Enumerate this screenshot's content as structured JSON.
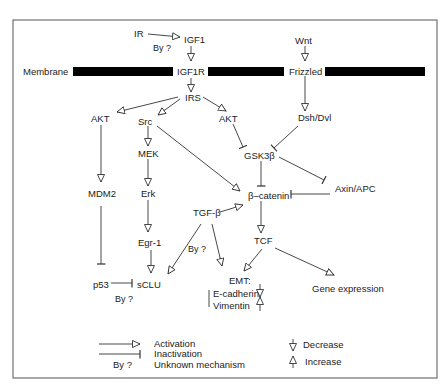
{
  "nodes": {
    "ir": {
      "label": "IR",
      "x": 138,
      "y": 37
    },
    "igf1": {
      "label": "IGF1",
      "x": 193,
      "y": 43
    },
    "by_ir": {
      "label": "By ?",
      "x": 153,
      "y": 51
    },
    "membrane": {
      "label": "Membrane",
      "x": 24,
      "y": 74
    },
    "igf1r": {
      "label": "IGF1R",
      "x": 178,
      "y": 74
    },
    "wnt": {
      "label": "Wnt",
      "x": 296,
      "y": 43
    },
    "frizzled": {
      "label": "Frizzled",
      "x": 290,
      "y": 71
    },
    "irs": {
      "label": "IRS",
      "x": 185,
      "y": 100
    },
    "akt_left": {
      "label": "AKT",
      "x": 91,
      "y": 121
    },
    "src": {
      "label": "Src",
      "x": 138,
      "y": 125
    },
    "akt_right": {
      "label": "AKT",
      "x": 219,
      "y": 121
    },
    "dsh_dvl": {
      "label": "Dsh/Dvl",
      "x": 299,
      "y": 121
    },
    "mek": {
      "label": "MEK",
      "x": 139,
      "y": 157
    },
    "gsk3b": {
      "label": "GSK3β",
      "x": 244,
      "y": 158
    },
    "mdm2": {
      "label": "MDM2",
      "x": 88,
      "y": 197
    },
    "erk": {
      "label": "Erk",
      "x": 141,
      "y": 197
    },
    "axin_apc": {
      "label": "Axin/APC",
      "x": 336,
      "y": 191
    },
    "b_catenin": {
      "label": "β–catenin",
      "x": 249,
      "y": 199
    },
    "tgfb": {
      "label": "TGF-β",
      "x": 194,
      "y": 216
    },
    "egr1": {
      "label": "Egr-1",
      "x": 138,
      "y": 246
    },
    "tcf": {
      "label": "TCF",
      "x": 254,
      "y": 244
    },
    "by_tgfb": {
      "label": "By ?",
      "x": 188,
      "y": 252
    },
    "p53": {
      "label": "p53",
      "x": 93,
      "y": 289
    },
    "sclu": {
      "label": "sCLU",
      "x": 138,
      "y": 288
    },
    "emt": {
      "label": "EMT:",
      "x": 230,
      "y": 284
    },
    "e_cadherin": {
      "label": "E-cadherin",
      "x": 214,
      "y": 298
    },
    "vimentin": {
      "label": "Vimentin",
      "x": 214,
      "y": 311
    },
    "gene_expression": {
      "label": "Gene expression",
      "x": 312,
      "y": 292
    },
    "by_p53": {
      "label": "By ?",
      "x": 116,
      "y": 302
    }
  },
  "legend": {
    "activation": "Activation",
    "inactivation": "Inactivation",
    "by_unknown": "By ?",
    "unknown_mechanism": "Unknown mechanism",
    "decrease": "Decrease",
    "increase": "Increase"
  }
}
